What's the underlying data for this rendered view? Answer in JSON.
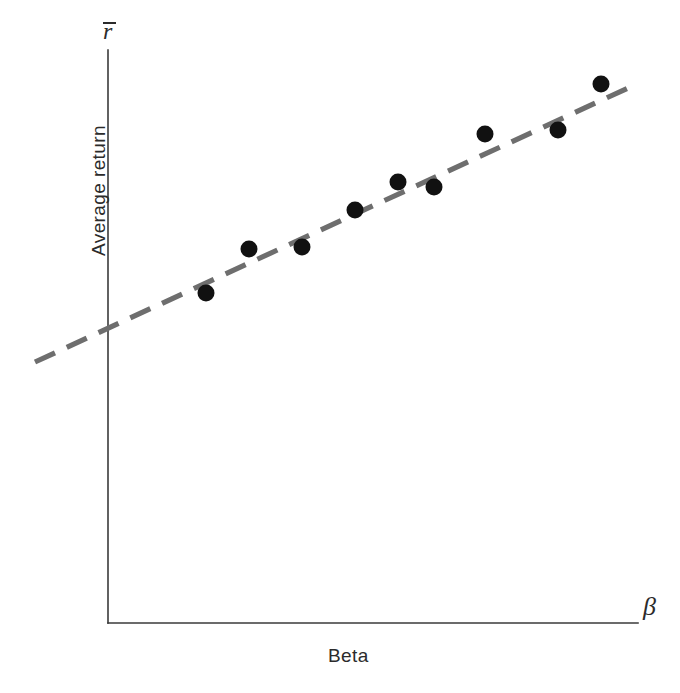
{
  "figure": {
    "background_color": "#ffffff",
    "width": 680,
    "height": 693
  },
  "axes": {
    "y_symbol": "r",
    "y_symbol_description": "r-bar (average return)",
    "x_symbol": "β",
    "y_title": "Average return",
    "x_title": "Beta",
    "axis_color": "#3a3a3a",
    "origin_px": [
      108,
      623
    ],
    "y_top_px": 50,
    "x_right_px": 638
  },
  "style": {
    "point_color": "#111111",
    "fit_line_color": "#6e6e6e",
    "point_radius_px": 8.5,
    "fit_dash_pattern": "22 13"
  },
  "chart_data": {
    "type": "scatter",
    "title": "",
    "subtitle": "",
    "xlabel": "Beta",
    "ylabel": "Average return",
    "x_axis_symbol": "β",
    "y_axis_symbol": "r̄",
    "grid": false,
    "legend": false,
    "legend_position": "none",
    "xlim": [
      0,
      1.6
    ],
    "ylim": [
      0,
      1.0
    ],
    "x_tick_labels": [],
    "y_tick_labels": [],
    "annotations": [],
    "series": [
      {
        "name": "Portfolio average returns",
        "type": "scatter",
        "marker": "filled-circle",
        "color": "#111111",
        "x": [
          0.37,
          0.53,
          0.6,
          0.77,
          0.91,
          1.02,
          1.22,
          1.49,
          1.63
        ],
        "y": [
          0.575,
          0.652,
          0.656,
          0.72,
          0.767,
          0.758,
          0.852,
          0.859,
          0.94
        ],
        "points_px": [
          [
            206,
            293
          ],
          [
            249,
            249
          ],
          [
            302,
            247
          ],
          [
            355,
            210
          ],
          [
            398,
            182
          ],
          [
            434,
            187
          ],
          [
            485,
            134
          ],
          [
            558,
            130
          ],
          [
            601,
            84
          ]
        ]
      },
      {
        "name": "Fitted security market line",
        "type": "line",
        "style": "dashed",
        "color": "#6e6e6e",
        "endpoints_px": [
          [
            35,
            362
          ],
          [
            628,
            88
          ]
        ],
        "x_range": [
          -0.28,
          1.74
        ],
        "y_range": [
          0.455,
          0.933
        ],
        "slope_px_per_px": -0.462
      }
    ]
  }
}
